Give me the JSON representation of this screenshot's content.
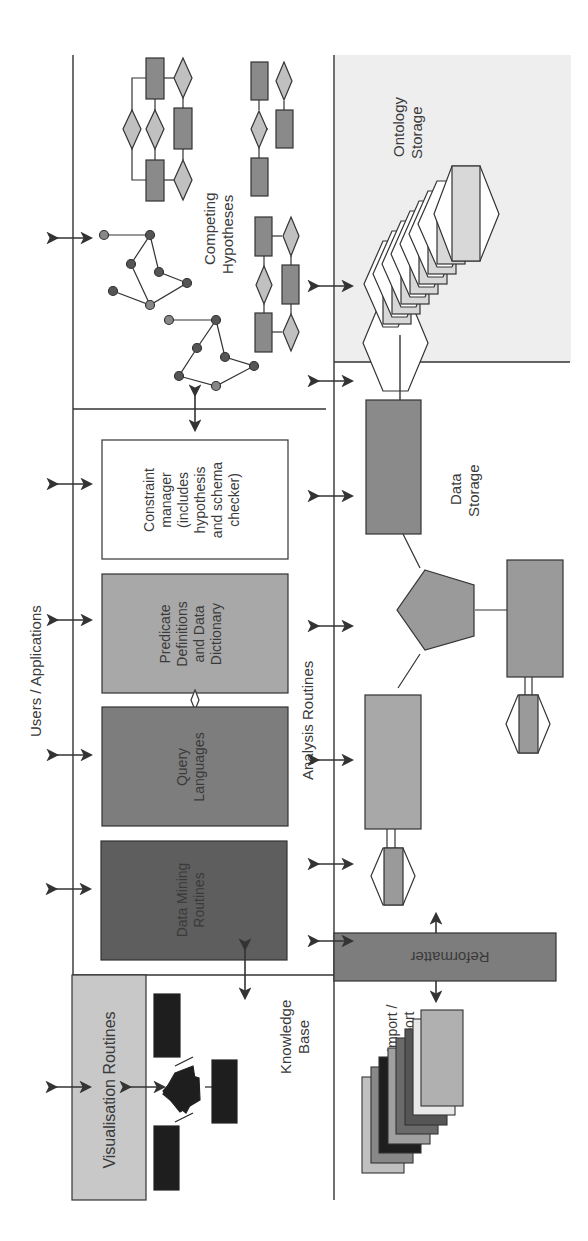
{
  "diagram": {
    "type": "architecture",
    "orientation": "rotated-90-ccw",
    "regions": {
      "users_applications": {
        "label": "Users / Applications"
      },
      "analysis_routines": {
        "label": "Analysis Routines"
      },
      "competing_hypotheses": {
        "label_line1": "Competing",
        "label_line2": "Hypotheses"
      },
      "ontology_storage": {
        "label_line1": "Ontology",
        "label_line2": "Storage"
      },
      "data_storage": {
        "label_line1": "Data",
        "label_line2": "Storage"
      },
      "knowledge_base": {
        "label_line1": "Knowledge",
        "label_line2": "Base"
      },
      "import_export": {
        "label_line1": "Import /",
        "label_line2": "Export"
      }
    },
    "components": {
      "constraint_manager": {
        "lines": [
          "Constraint",
          "manager",
          "(includes",
          "hypothesis",
          "and schema",
          "checker)"
        ]
      },
      "predicate_definitions": {
        "lines": [
          "Predicate",
          "Definitions",
          "and Data",
          "Dictionary"
        ]
      },
      "query_languages": {
        "lines": [
          "Query",
          "Languages"
        ]
      },
      "data_mining": {
        "lines": [
          "Data Mining",
          "Routines"
        ]
      },
      "visualisation": {
        "label": "Visualisation Routines"
      },
      "reformatter": {
        "label": "Reformatter"
      }
    },
    "colors": {
      "dark": "#5e5e5e",
      "mid": "#7d7d7d",
      "light": "#a8a8a8",
      "pale": "#c8c8c8",
      "black": "#1e1e1e",
      "ontology_bg": "#eeeeee"
    }
  }
}
